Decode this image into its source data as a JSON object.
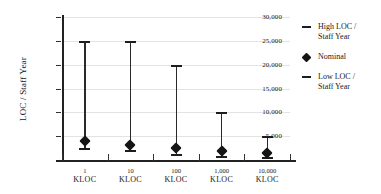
{
  "chart_data": {
    "type": "bar",
    "subtype": "high-low-nominal range plot",
    "title": "",
    "xlabel": "",
    "ylabel": "LOC / Staff Year",
    "categories": [
      "1\nKLOC",
      "10\nKLOC",
      "100\nKLOC",
      "1,000\nKLOC",
      "10,000\nKLOC"
    ],
    "category_values": [
      "1",
      "10",
      "100",
      "1,000",
      "10,000"
    ],
    "category_unit": "KLOC",
    "ylim": [
      0,
      30000
    ],
    "ytick_values": [
      0,
      5000,
      10000,
      15000,
      20000,
      25000,
      30000
    ],
    "ytick_labels": [
      "-",
      "5,000",
      "10,000",
      "15,000",
      "20,000",
      "25,000",
      "30,000"
    ],
    "grid": true,
    "grid_axis": "y",
    "legend_position": "right",
    "series": [
      {
        "name": "High LOC / Staff Year",
        "values": [
          25000,
          25000,
          20000,
          10000,
          5000
        ]
      },
      {
        "name": "Nominal",
        "values": [
          4000,
          3200,
          2500,
          1800,
          1500
        ]
      },
      {
        "name": "Low LOC / Staff Year",
        "values": [
          2500,
          2100,
          1300,
          900,
          700
        ]
      }
    ],
    "colors": {
      "marker": "#151515",
      "line": "#2a2a2a",
      "grid": "#e3e3e3",
      "axis": "#222222",
      "background": "#ffffff"
    }
  },
  "legend": {
    "entries": [
      {
        "label": "High LOC /\nStaff Year",
        "glyph": "dash-icon"
      },
      {
        "label": "Nominal",
        "glyph": "diamond-icon"
      },
      {
        "label": "Low LOC /\nStaff Year",
        "glyph": "dash-icon"
      }
    ]
  },
  "axes": {
    "y_title": "LOC / Staff Year"
  }
}
